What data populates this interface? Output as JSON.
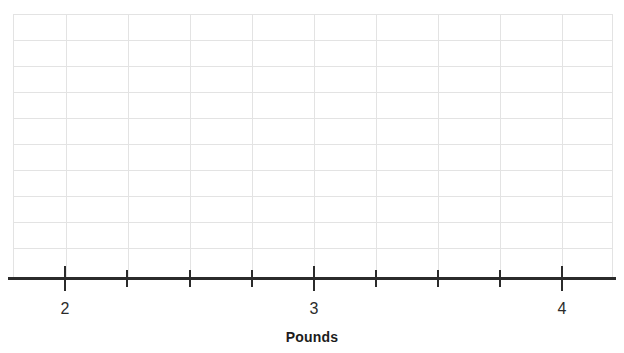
{
  "chart_data": {
    "type": "line",
    "title": "",
    "subtitle": "",
    "xlabel": "Pounds",
    "ylabel": "",
    "xlim": [
      1.75,
      4.25
    ],
    "ylim": [
      0,
      11
    ],
    "grid": true,
    "legend": null,
    "series": [],
    "data_points": [],
    "x_major_ticks": [
      2,
      3,
      4
    ],
    "x_major_tick_labels": [
      "2",
      "3",
      "4"
    ],
    "x_minor_ticks": [
      2.25,
      2.5,
      2.75,
      3.25,
      3.5,
      3.75
    ],
    "x_tick_interval": 0.25,
    "y_ticks": [],
    "y_tick_labels": [],
    "grid_rows": 10,
    "grid_columns": 10
  },
  "axis": {
    "title": "Pounds",
    "ticks": [
      {
        "x": 65,
        "kind": "major",
        "label": "2"
      },
      {
        "x": 127,
        "kind": "minor",
        "label": ""
      },
      {
        "x": 190,
        "kind": "minor",
        "label": ""
      },
      {
        "x": 252,
        "kind": "minor",
        "label": ""
      },
      {
        "x": 314,
        "kind": "major",
        "label": "3"
      },
      {
        "x": 376,
        "kind": "minor",
        "label": ""
      },
      {
        "x": 438,
        "kind": "minor",
        "label": ""
      },
      {
        "x": 500,
        "kind": "minor",
        "label": ""
      },
      {
        "x": 562,
        "kind": "major",
        "label": "4"
      }
    ]
  },
  "grid": {
    "horizontal_lines_y": [
      0,
      26,
      52,
      78,
      104,
      130,
      156,
      182,
      208,
      234,
      263
    ],
    "vertical_lines_x": [
      0,
      53,
      115,
      177,
      239,
      301,
      363,
      425,
      487,
      549,
      599
    ]
  },
  "colors": {
    "grid_line": "#e3e3e3",
    "axis_line": "#2b2b2b",
    "tick": "#2b2b2b",
    "label_text": "#2b2b2b",
    "title_text": "#1c1c1c",
    "background": "#ffffff"
  }
}
